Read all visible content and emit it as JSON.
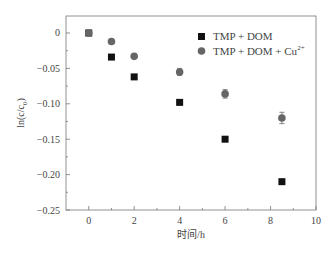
{
  "chart_data": {
    "type": "scatter",
    "title": "",
    "xlabel": "时间/h",
    "ylabel": "ln(c/c0)",
    "xlim": [
      -1,
      10
    ],
    "ylim": [
      -0.25,
      0.024
    ],
    "xticks": [
      0,
      2,
      4,
      6,
      8,
      10
    ],
    "xtick_labels": [
      "0",
      "2",
      "4",
      "6",
      "8",
      "10"
    ],
    "yticks": [
      0,
      -0.05,
      -0.1,
      -0.15,
      -0.2,
      -0.25
    ],
    "ytick_labels": [
      "0",
      "−0.05",
      "−0.10",
      "−0.15",
      "−0.20",
      "−0.25"
    ],
    "grid": false,
    "legend_position": "upper right",
    "series": [
      {
        "name": "TMP + DOM",
        "marker": "square",
        "color": "#111111",
        "x": [
          0,
          1,
          2,
          4,
          6,
          8.5
        ],
        "y": [
          0,
          -0.034,
          -0.062,
          -0.098,
          -0.15,
          -0.21
        ],
        "error": [
          0,
          0,
          0,
          0,
          0,
          0
        ]
      },
      {
        "name": "TMP + DOM + Cu2+",
        "marker": "circle",
        "color": "#666666",
        "x": [
          0,
          1,
          2,
          4,
          6,
          8.5
        ],
        "y": [
          0,
          -0.012,
          -0.033,
          -0.055,
          -0.086,
          -0.12
        ],
        "error": [
          0.002,
          0.002,
          0.003,
          0.005,
          0.006,
          0.008
        ]
      }
    ]
  },
  "legend": {
    "item1_label": "TMP + DOM",
    "item2_label_base": "TMP + DOM + Cu",
    "item2_label_sup": "2+"
  },
  "axes": {
    "xlabel": "时间/h",
    "ylabel_prefix": "ln(c/c",
    "ylabel_sub": "0",
    "ylabel_suffix": ")"
  }
}
